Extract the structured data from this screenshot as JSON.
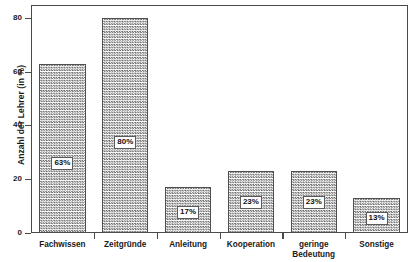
{
  "chart_data": {
    "type": "bar",
    "title": "",
    "xlabel": "",
    "ylabel": "Anzahl der Lehrer (in %)",
    "categories": [
      "Fachwissen",
      "Zeitgründe",
      "Anleitung",
      "Kooperation",
      "geringe Bedeutung",
      "Sonstige"
    ],
    "category_lines": [
      [
        "Fachwissen"
      ],
      [
        "Zeitgründe"
      ],
      [
        "Anleitung"
      ],
      [
        "Kooperation"
      ],
      [
        "geringe",
        "Bedeutung"
      ],
      [
        "Sonstige"
      ]
    ],
    "values": [
      63,
      80,
      17,
      23,
      23,
      13
    ],
    "data_labels": [
      "63%",
      "80%",
      "17%",
      "23%",
      "23%",
      "13%"
    ],
    "ylim": [
      0,
      85
    ],
    "yticks": [
      0,
      20,
      40,
      60,
      80
    ],
    "ytick_labels": [
      "0",
      "20",
      "40",
      "60",
      "80"
    ],
    "grid": false,
    "legend": null,
    "bar_fill": "#6d6d6d",
    "bar_edge": "#4f4f4f",
    "axis_color": "#4a4a4a",
    "text_color": "#1a1a1a"
  }
}
